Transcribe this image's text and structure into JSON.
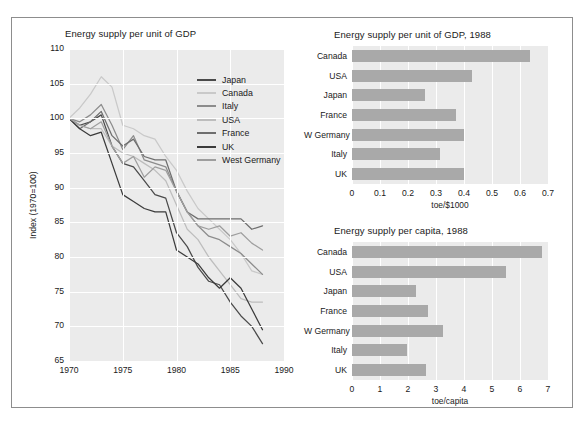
{
  "figure": {
    "border_color": "#8d8d8d",
    "plot_background": "#ebebeb",
    "bar_color": "#a9a9a9"
  },
  "chart_data": [
    {
      "id": "line",
      "type": "line",
      "title": "Energy supply per unit of GDP",
      "xlabel": "",
      "ylabel": "Index (1970=100)",
      "xlim": [
        1970,
        1990
      ],
      "ylim": [
        65,
        110
      ],
      "xticks": [
        1970,
        1975,
        1980,
        1985,
        1990
      ],
      "yticks": [
        65,
        70,
        75,
        80,
        85,
        90,
        95,
        100,
        105,
        110
      ],
      "grid": true,
      "legend_position": "upper-right-inside",
      "x": [
        1970,
        1971,
        1972,
        1973,
        1974,
        1975,
        1976,
        1977,
        1978,
        1979,
        1980,
        1981,
        1982,
        1983,
        1984,
        1985,
        1986,
        1987,
        1988
      ],
      "series": [
        {
          "name": "Japan",
          "color": "#4a4a4a",
          "values": [
            100.0,
            99.0,
            99.5,
            100.5,
            96.0,
            93.5,
            93.0,
            91.0,
            89.0,
            88.5,
            83.5,
            81.5,
            78.5,
            76.5,
            76.0,
            73.5,
            71.5,
            70.0,
            67.5
          ]
        },
        {
          "name": "Canada",
          "color": "#c9c9c9",
          "values": [
            100.0,
            101.5,
            103.5,
            106.0,
            104.5,
            99.0,
            98.5,
            97.5,
            97.0,
            94.5,
            92.5,
            89.5,
            87.0,
            85.5,
            84.0,
            82.5,
            80.5,
            78.0,
            77.5
          ]
        },
        {
          "name": "Italy",
          "color": "#8c8c8c",
          "values": [
            100.0,
            99.5,
            100.5,
            102.0,
            99.0,
            95.5,
            97.5,
            94.0,
            93.5,
            93.0,
            89.5,
            86.5,
            84.5,
            83.0,
            82.5,
            81.5,
            80.5,
            79.0,
            77.5
          ]
        },
        {
          "name": "USA",
          "color": "#bdbdbd",
          "values": [
            100.0,
            99.0,
            98.5,
            98.5,
            96.0,
            95.0,
            94.5,
            93.5,
            92.5,
            91.0,
            87.5,
            84.0,
            82.5,
            80.0,
            78.0,
            76.0,
            74.0,
            73.5,
            73.5
          ]
        },
        {
          "name": "France",
          "color": "#6e6e6e",
          "values": [
            100.0,
            98.5,
            99.5,
            101.0,
            97.5,
            96.0,
            97.0,
            94.5,
            94.0,
            94.0,
            89.5,
            86.5,
            85.5,
            85.5,
            85.5,
            85.5,
            85.5,
            84.0,
            84.5
          ]
        },
        {
          "name": "UK",
          "color": "#3b3b3b",
          "values": [
            100.0,
            98.5,
            97.5,
            98.0,
            93.5,
            89.0,
            88.0,
            87.0,
            86.5,
            86.5,
            81.0,
            80.0,
            79.0,
            77.0,
            75.5,
            77.0,
            75.5,
            72.5,
            69.5
          ]
        },
        {
          "name": "West Germany",
          "color": "#9e9e9e",
          "values": [
            100.0,
            99.0,
            98.5,
            99.5,
            96.0,
            93.5,
            94.5,
            91.5,
            93.0,
            92.5,
            89.5,
            86.5,
            84.5,
            84.0,
            84.5,
            83.0,
            83.5,
            82.0,
            81.0
          ]
        }
      ]
    },
    {
      "id": "bar-gdp",
      "type": "bar",
      "orientation": "horizontal",
      "title": "Energy supply per unit of GDP, 1988",
      "xlabel": "toe/$1000",
      "ylabel": "",
      "xlim": [
        0,
        0.7
      ],
      "xticks": [
        "0",
        "0.1",
        "0.2",
        "0.3",
        "0.4",
        "0.5",
        "0.6",
        "0.7"
      ],
      "xtick_values": [
        0,
        0.1,
        0.2,
        0.3,
        0.4,
        0.5,
        0.6,
        0.7
      ],
      "grid": true,
      "categories": [
        "Canada",
        "USA",
        "Japan",
        "France",
        "W Germany",
        "Italy",
        "UK"
      ],
      "values": [
        0.635,
        0.43,
        0.26,
        0.37,
        0.4,
        0.315,
        0.4
      ]
    },
    {
      "id": "bar-capita",
      "type": "bar",
      "orientation": "horizontal",
      "title": "Energy supply per capita, 1988",
      "xlabel": "toe/capita",
      "ylabel": "",
      "xlim": [
        0,
        7
      ],
      "xticks": [
        "0",
        "1",
        "2",
        "3",
        "4",
        "5",
        "6",
        "7"
      ],
      "xtick_values": [
        0,
        1,
        2,
        3,
        4,
        5,
        6,
        7
      ],
      "grid": true,
      "categories": [
        "Canada",
        "USA",
        "Japan",
        "France",
        "W Germany",
        "Italy",
        "UK"
      ],
      "values": [
        6.8,
        5.5,
        2.3,
        2.7,
        3.25,
        1.95,
        2.65
      ]
    }
  ]
}
